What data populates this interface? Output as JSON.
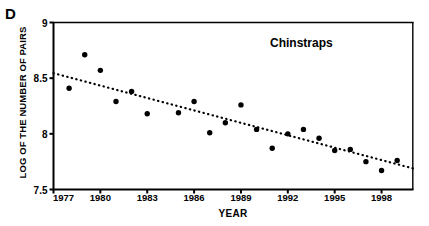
{
  "panel": {
    "label": "D"
  },
  "chart_data": {
    "type": "scatter",
    "title": "",
    "series_label": "Chinstraps",
    "xlabel": "YEAR",
    "ylabel": "LOG OF THE NUMBER OF PAIRS",
    "xlim": [
      1977,
      2000
    ],
    "ylim": [
      7.5,
      9.0
    ],
    "grid": false,
    "legend_position": "inside-top-right",
    "xticks": [
      1977,
      1980,
      1983,
      1986,
      1989,
      1992,
      1995,
      1998
    ],
    "xtick_labels": [
      "1977",
      "1980",
      "1983",
      "1986",
      "1989",
      "1992",
      "1995",
      "1998"
    ],
    "yticks": [
      7.5,
      8,
      8.5,
      9
    ],
    "ytick_labels": [
      "7.5",
      "8",
      "8.5",
      "9"
    ],
    "marker": "filled-circle",
    "marker_color": "#000000",
    "series": [
      {
        "name": "Chinstraps",
        "points": [
          {
            "x": 1978,
            "y": 8.41
          },
          {
            "x": 1979,
            "y": 8.71
          },
          {
            "x": 1980,
            "y": 8.57
          },
          {
            "x": 1981,
            "y": 8.29
          },
          {
            "x": 1982,
            "y": 8.38
          },
          {
            "x": 1983,
            "y": 8.18
          },
          {
            "x": 1985,
            "y": 8.19
          },
          {
            "x": 1986,
            "y": 8.29
          },
          {
            "x": 1987,
            "y": 8.01
          },
          {
            "x": 1988,
            "y": 8.1
          },
          {
            "x": 1989,
            "y": 8.26
          },
          {
            "x": 1990,
            "y": 8.04
          },
          {
            "x": 1991,
            "y": 7.87
          },
          {
            "x": 1992,
            "y": 8.0
          },
          {
            "x": 1993,
            "y": 8.04
          },
          {
            "x": 1994,
            "y": 7.96
          },
          {
            "x": 1995,
            "y": 7.85
          },
          {
            "x": 1996,
            "y": 7.86
          },
          {
            "x": 1997,
            "y": 7.75
          },
          {
            "x": 1998,
            "y": 7.67
          },
          {
            "x": 1999,
            "y": 7.76
          }
        ]
      }
    ],
    "trendline": {
      "style": "dotted",
      "color": "#000000",
      "x_start": 1977,
      "y_start": 8.545,
      "x_end": 2000,
      "y_end": 7.69
    }
  }
}
